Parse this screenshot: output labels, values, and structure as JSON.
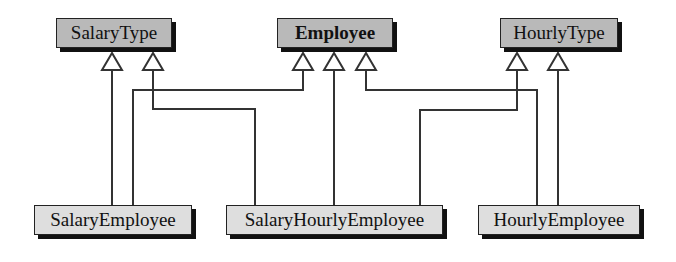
{
  "diagram": {
    "title": "",
    "superclasses": [
      {
        "id": "salarytype",
        "label": "SalaryType",
        "bold": false
      },
      {
        "id": "employee",
        "label": "Employee",
        "bold": true
      },
      {
        "id": "hourlytype",
        "label": "HourlyType",
        "bold": false
      }
    ],
    "subclasses": [
      {
        "id": "salaryemployee",
        "label": "SalaryEmployee"
      },
      {
        "id": "salaryhourlyemployee",
        "label": "SalaryHourlyEmployee"
      },
      {
        "id": "hourlyemployee",
        "label": "HourlyEmployee"
      }
    ],
    "inheritance": [
      {
        "from": "SalaryEmployee",
        "to": "SalaryType"
      },
      {
        "from": "SalaryEmployee",
        "to": "Employee"
      },
      {
        "from": "SalaryHourlyEmployee",
        "to": "SalaryType"
      },
      {
        "from": "SalaryHourlyEmployee",
        "to": "Employee"
      },
      {
        "from": "SalaryHourlyEmployee",
        "to": "HourlyType"
      },
      {
        "from": "HourlyEmployee",
        "to": "Employee"
      },
      {
        "from": "HourlyEmployee",
        "to": "HourlyType"
      }
    ],
    "colors": {
      "superclass_fill": "#b9b9b9",
      "subclass_fill": "#dedede",
      "line": "#333333"
    }
  }
}
